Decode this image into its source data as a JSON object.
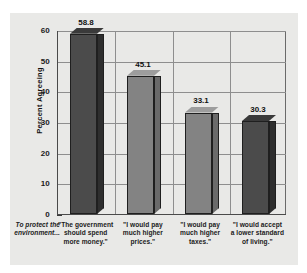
{
  "chart_data": {
    "type": "bar",
    "title": "",
    "subtitle": "",
    "xlabel": "",
    "ylabel": "Percent Agreeing",
    "lead_in_label": "To protect the environment...",
    "categories": [
      "\"The government should spend more money.\"",
      "\"I would pay much higher prices.\"",
      "\"I would pay much higher taxes.\"",
      "\"I would accept a lower standard of living.\""
    ],
    "category_lines": [
      [
        "\"The government",
        "should spend",
        "more money.\""
      ],
      [
        "\"I would pay",
        "much higher",
        "prices.\""
      ],
      [
        "\"I would pay",
        "much higher",
        "taxes.\""
      ],
      [
        "\"I would accept",
        "a lower standard",
        "of living.\""
      ]
    ],
    "values": [
      58.8,
      45.1,
      33.1,
      30.3
    ],
    "value_labels": [
      "58.8",
      "45.1",
      "33.1",
      "30.3"
    ],
    "ylim": [
      0,
      60
    ],
    "yticks": [
      0,
      10,
      20,
      30,
      40,
      50,
      60
    ],
    "ytick_labels": [
      "0",
      "10",
      "20",
      "30",
      "40",
      "50",
      "60"
    ],
    "grid": true,
    "grid_axis": "both",
    "legend": false,
    "legend_position": "none",
    "bar_colors": [
      "#4b4b4b",
      "#838383",
      "#838383",
      "#4b4b4b"
    ],
    "bar_top_colors": [
      "#3a3a3a",
      "#9d9d9d",
      "#9d9d9d",
      "#3a3a3a"
    ],
    "bar_side_colors": [
      "#2e2e2e",
      "#6a6a6a",
      "#6a6a6a",
      "#2e2e2e"
    ],
    "plot_background": "#e9e9e7",
    "axis_color": "#4a4a4a",
    "grid_color": "#8e8e8e"
  },
  "figure": {
    "background": "#ffffff",
    "panel_background": "#e9e9e7"
  }
}
